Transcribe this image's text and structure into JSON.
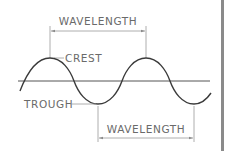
{
  "diagram": {
    "labels": {
      "top_wavelength": "WAVELENGTH",
      "crest": "CREST",
      "trough": "TROUGH",
      "bottom_wavelength": "WAVELENGTH"
    },
    "colors": {
      "wave": "#3a3a3a",
      "axis": "#555555",
      "annotation": "#9a9a9a",
      "text": "#6a6a6a",
      "border": "#8a8a8a"
    }
  }
}
